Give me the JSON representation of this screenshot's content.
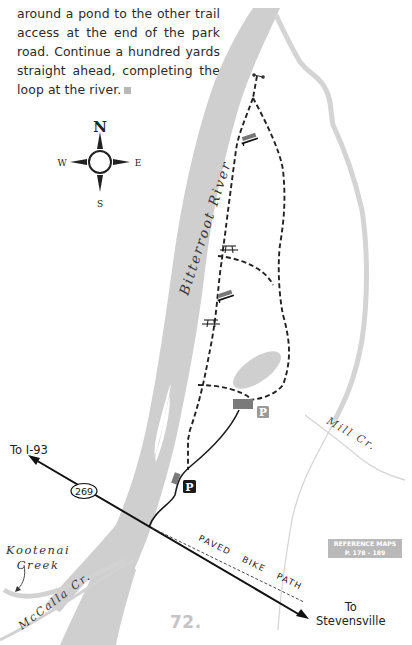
{
  "intro": {
    "lines": [
      "around a pond to the other trail",
      "access at the end of the park",
      "road. Continue a hundred yards",
      "straight ahead, completing the",
      "loop at the river."
    ]
  },
  "compass": {
    "north": "N",
    "south": "S",
    "east": "E",
    "west": "W"
  },
  "map_labels": {
    "river": "Bitterroot River",
    "mill_creek": "Mill Cr.",
    "mccalla_creek": "McCalla Cr.",
    "kootenai_creek_line1": "Kootenai",
    "kootenai_creek_line2": "Creek",
    "paved_bike_path": "PAVED BIKE PATH",
    "highway_number": "269",
    "to_i93": "To I-93",
    "to_stevensville_line1": "To",
    "to_stevensville_line2": "Stevensville",
    "parking_symbol": "P"
  },
  "reference_maps": {
    "line1": "REFERENCE MAPS",
    "line2": "P. 178 - 189"
  },
  "page": {
    "hike_number": "72."
  },
  "colors": {
    "water": "#cfcfcf",
    "trail": "#222222",
    "road": "#1a1a1a",
    "parking_lot": "#7a7a7a",
    "parking_dark": "#1a1a1a",
    "parking_light": "#9a9a9a",
    "page_number": "#c4c4c4"
  }
}
